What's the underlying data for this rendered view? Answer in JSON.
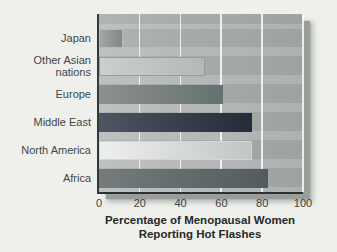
{
  "figure": {
    "background_color": "#eff0ec",
    "panel_color": "#a6abaa",
    "shadow_color": "#999e9b",
    "gridline_color": "#ffffff",
    "axis_line_color": "#2c3133"
  },
  "axis_title": {
    "line1": "Percentage of Menopausal Women",
    "line2": "Reporting Hot Flashes"
  },
  "chart_data": {
    "type": "bar",
    "orientation": "horizontal",
    "title": "Percentage of Menopausal Women Reporting Hot Flashes",
    "xlabel": "Percentage of Menopausal Women Reporting Hot Flashes",
    "ylabel": "",
    "xlim": [
      0,
      100
    ],
    "x_ticks": [
      0,
      20,
      40,
      60,
      80,
      100
    ],
    "grid": "vertical-white-gridlines",
    "legend": "none",
    "categories": [
      "Japan",
      "Other Asian nations",
      "Europe",
      "Middle East",
      "North America",
      "Africa"
    ],
    "values": [
      12,
      52,
      61,
      75,
      75,
      83
    ],
    "bars": [
      {
        "label": "Japan",
        "value": 12,
        "fill_start": "#a2a9a7",
        "fill_end": "#7f8886",
        "border": "#b6bbb8"
      },
      {
        "label": "Other Asian nations",
        "value": 52,
        "fill_start": "#cbd0cd",
        "fill_end": "#b3b9b7",
        "border": "#979d9d"
      },
      {
        "label": "Europe",
        "value": 61,
        "fill_start": "#8a9290",
        "fill_end": "#667070",
        "border": ""
      },
      {
        "label": "Middle East",
        "value": 75,
        "fill_start": "#4e5664",
        "fill_end": "#242b39",
        "border": ""
      },
      {
        "label": "North America",
        "value": 75,
        "fill_start": "#eef0ed",
        "fill_end": "#c1c6c4",
        "border": "#d3d7d4"
      },
      {
        "label": "Africa",
        "value": 83,
        "fill_start": "#747d7c",
        "fill_end": "#525b5e",
        "border": ""
      }
    ]
  }
}
